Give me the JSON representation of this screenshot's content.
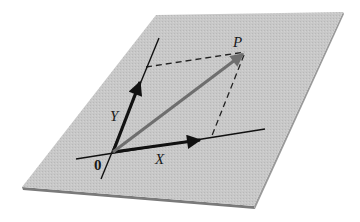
{
  "diagram": {
    "type": "vector-decomposition-on-plane",
    "labels": {
      "point": "P",
      "y_axis": "Y",
      "x_axis": "X",
      "origin": "0"
    },
    "colors": {
      "plane_fill": "#c6c6c6",
      "plane_edge": "#8a8a8a",
      "axis": "#111111",
      "vector_p": "#6e6e6e",
      "dashed": "#222222",
      "background": "#ffffff"
    },
    "geometry": {
      "plane_corners": [
        [
          156,
          15
        ],
        [
          343,
          12
        ],
        [
          254,
          206
        ],
        [
          22,
          187
        ]
      ],
      "origin": [
        113,
        152
      ],
      "x_axis_line": [
        [
          76,
          159
        ],
        [
          265,
          129
        ]
      ],
      "y_axis_line": [
        [
          101,
          179
        ],
        [
          159,
          38
        ]
      ],
      "x_arrow_tip": [
        200,
        140
      ],
      "y_arrow_tip": [
        140,
        82
      ],
      "p_point": [
        243,
        54
      ],
      "dashed_top": [
        [
          146,
          67
        ],
        [
          245,
          52
        ]
      ],
      "dashed_right": [
        [
          244,
          55
        ],
        [
          211,
          138
        ]
      ]
    }
  }
}
